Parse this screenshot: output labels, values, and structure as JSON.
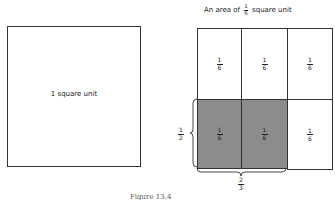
{
  "left": {
    "label": "1 square unit"
  },
  "right": {
    "title_prefix": "An area of",
    "title_frac": {
      "num": "1",
      "den": "6"
    },
    "title_suffix": "square unit",
    "cells": [
      {
        "row": 0,
        "col": 0,
        "num": "1",
        "den": "6",
        "shaded": false
      },
      {
        "row": 0,
        "col": 1,
        "num": "1",
        "den": "6",
        "shaded": false
      },
      {
        "row": 0,
        "col": 2,
        "num": "1",
        "den": "6",
        "shaded": false
      },
      {
        "row": 1,
        "col": 0,
        "num": "1",
        "den": "6",
        "shaded": true
      },
      {
        "row": 1,
        "col": 1,
        "num": "1",
        "den": "6",
        "shaded": true
      },
      {
        "row": 1,
        "col": 2,
        "num": "1",
        "den": "6",
        "shaded": false
      }
    ],
    "side_brace": {
      "num": "1",
      "den": "2"
    },
    "bottom_brace": {
      "num": "2",
      "den": "3"
    },
    "shade_color": "#8c8c8c"
  },
  "caption": "Figure 13.4"
}
